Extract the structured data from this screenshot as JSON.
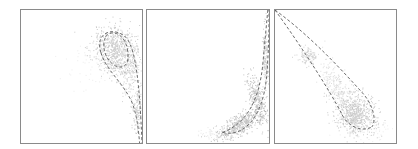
{
  "chart_data": [
    {
      "type": "scatter",
      "title": "",
      "xlabel": "",
      "ylabel": "",
      "grid": false,
      "legend": null,
      "frame": {
        "x": 20,
        "y": 9,
        "w": 123,
        "h": 135
      },
      "description": "Dense gray point cloud in upper-right with dashed boundary curves curving down to the lower-right edge",
      "clusters": [
        {
          "cx": 0.78,
          "cy": 0.3,
          "sx": 0.09,
          "sy": 0.09,
          "rot": 0.5,
          "n": 700,
          "opacity": 0.35
        },
        {
          "cx": 0.9,
          "cy": 0.45,
          "sx": 0.04,
          "sy": 0.1,
          "rot": 0.1,
          "n": 160,
          "opacity": 0.3
        },
        {
          "cx": 0.96,
          "cy": 0.75,
          "sx": 0.02,
          "sy": 0.1,
          "rot": 0.0,
          "n": 140,
          "opacity": 0.35
        },
        {
          "cx": 0.6,
          "cy": 0.4,
          "sx": 0.14,
          "sy": 0.1,
          "rot": 0.0,
          "n": 60,
          "opacity": 0.12
        }
      ],
      "dashed_curves": [
        "M 0.66 0.32 C 0.60 0.15, 0.80 0.12, 0.88 0.22 C 0.95 0.32, 0.98 0.55, 1.00 1.00",
        "M 0.66 0.32 C 0.70 0.45, 0.85 0.55, 0.92 0.70 C 0.96 0.80, 0.97 0.90, 0.98 1.00",
        "M 0.70 0.20 C 0.75 0.14, 0.86 0.18, 0.88 0.30 C 0.90 0.40, 0.86 0.45, 0.78 0.42 C 0.70 0.38, 0.66 0.28, 0.70 0.20"
      ]
    },
    {
      "type": "scatter",
      "title": "",
      "xlabel": "",
      "ylabel": "",
      "grid": false,
      "legend": null,
      "frame": {
        "x": 146,
        "y": 9,
        "w": 124,
        "h": 135
      },
      "description": "Curved banana-shaped point cloud rising steeply along right edge from bottom-center, with dashed boundary curves",
      "clusters": [
        {
          "cx": 0.76,
          "cy": 0.86,
          "sx": 0.1,
          "sy": 0.035,
          "rot": -0.5,
          "n": 450,
          "opacity": 0.4
        },
        {
          "cx": 0.9,
          "cy": 0.68,
          "sx": 0.03,
          "sy": 0.1,
          "rot": -0.3,
          "n": 300,
          "opacity": 0.4
        },
        {
          "cx": 0.97,
          "cy": 0.35,
          "sx": 0.012,
          "sy": 0.14,
          "rot": 0.0,
          "n": 160,
          "opacity": 0.35
        },
        {
          "cx": 0.55,
          "cy": 0.93,
          "sx": 0.07,
          "sy": 0.02,
          "rot": 0.0,
          "n": 60,
          "opacity": 0.15
        }
      ],
      "dashed_curves": [
        "M 0.62 0.92 C 0.80 0.86, 0.92 0.70, 0.95 0.40 C 0.97 0.20, 0.98 0.10, 0.99 0.00",
        "M 0.62 0.92 C 0.78 0.96, 0.95 0.82, 0.98 0.50 C 1.00 0.30, 1.00 0.10, 1.00 0.00"
      ]
    },
    {
      "type": "scatter",
      "title": "",
      "xlabel": "",
      "ylabel": "",
      "grid": false,
      "legend": null,
      "frame": {
        "x": 274,
        "y": 9,
        "w": 123,
        "h": 135
      },
      "description": "Diagonal wedge of points from upper-left to dense cluster in lower-right, bounded by two dashed lines converging at top-left corner",
      "clusters": [
        {
          "cx": 0.66,
          "cy": 0.78,
          "sx": 0.09,
          "sy": 0.075,
          "rot": 0.6,
          "n": 650,
          "opacity": 0.35
        },
        {
          "cx": 0.5,
          "cy": 0.57,
          "sx": 0.05,
          "sy": 0.1,
          "rot": -0.5,
          "n": 220,
          "opacity": 0.22
        },
        {
          "cx": 0.27,
          "cy": 0.34,
          "sx": 0.04,
          "sy": 0.03,
          "rot": 0.3,
          "n": 110,
          "opacity": 0.3
        },
        {
          "cx": 0.75,
          "cy": 0.88,
          "sx": 0.12,
          "sy": 0.05,
          "rot": 0.0,
          "n": 80,
          "opacity": 0.12
        }
      ],
      "dashed_curves": [
        "M 0.00 0.00 C 0.20 0.25, 0.45 0.60, 0.55 0.78 C 0.60 0.88, 0.72 0.92, 0.80 0.88",
        "M 0.00 0.00 C 0.30 0.20, 0.55 0.45, 0.72 0.62 C 0.82 0.72, 0.84 0.84, 0.80 0.88"
      ]
    }
  ]
}
